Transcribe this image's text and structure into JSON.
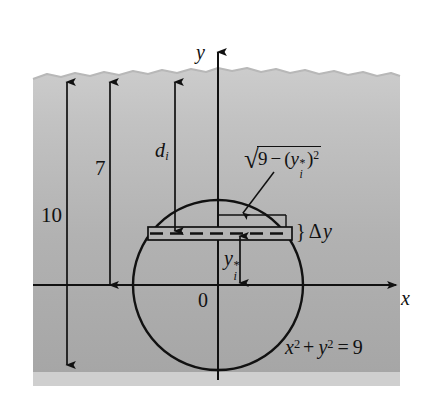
{
  "figure": {
    "kind": "hydrostatic-force-diagram",
    "colors": {
      "water_fill_top": "#c9c9c9",
      "water_fill_bottom": "#a9a9a9",
      "seabed_band": "#cfcfcf",
      "stroke": "#111111",
      "page_background": "#ffffff",
      "strip_fill": "#b4b4b4"
    }
  },
  "axes": {
    "y_axis_label": "y",
    "x_axis_label": "x",
    "origin_label": "0"
  },
  "dimensions": [
    {
      "name": "total-depth",
      "label": "10"
    },
    {
      "name": "depth-to-origin",
      "label": "7"
    }
  ],
  "annotations": {
    "depth_to_strip": {
      "base": "d",
      "sub": "i"
    },
    "strip_height": {
      "brace": "}",
      "delta": "Δ",
      "variable": "y"
    },
    "half_width": {
      "radical_sign": "√",
      "inner_number": "9",
      "minus": "−",
      "open_paren": "(",
      "variable": "y",
      "sub": "i",
      "star": "*",
      "close_paren": ")",
      "exponent": "2"
    },
    "strip_center_height": {
      "base": "y",
      "sub": "i",
      "star": "*"
    },
    "circle_equation": {
      "x": "x",
      "x_exp": "2",
      "plus": "+",
      "y": "y",
      "y_exp": "2",
      "equals": "=",
      "value": "9"
    }
  },
  "geometry": {
    "circle": {
      "cx": 218,
      "cy": 285,
      "r": 85,
      "equation": "x^2 + y^2 = 9",
      "radius_units": 3
    },
    "water_surface_y": 73,
    "x_axis_y": 285,
    "y_axis_x": 218,
    "strip": {
      "x1": 148,
      "x2": 292,
      "top_y": 227,
      "bottom_y": 240,
      "dash_y": 233
    }
  }
}
